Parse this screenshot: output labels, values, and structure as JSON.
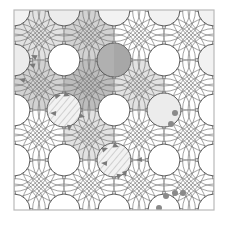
{
  "figure": {
    "type": "geometric-diagram",
    "width": 227,
    "height": 232,
    "background_color": "#ffffff"
  },
  "chart_data": {
    "type": "scatter",
    "xlabel": "",
    "ylabel": "",
    "xlim": [
      0,
      4
    ],
    "ylim": [
      0,
      4
    ],
    "grid": true,
    "legend": "none"
  },
  "frame": {
    "x": 14,
    "y": 10,
    "width": 200,
    "height": 200,
    "cells_x": 4,
    "cells_y": 4,
    "cell_size": 50,
    "border_color": "#b9b9b9",
    "grid_color": "#cfcfcf"
  },
  "colors": {
    "arc_stroke": "#6e6e6e",
    "arc_stroke_dark": "#5a5a5a",
    "shade_light": "#e2e2e2",
    "shade_mid": "#d2d2d2",
    "shade_dark": "#bdbdbd",
    "circle_fill_light": "#f2f2f2",
    "circle_fill_pale": "#ececec",
    "circle_fill_mid": "#d8d8d8",
    "circle_fill_dark": "#b0b0b0",
    "marker_fill": "#8a8a8a",
    "arrow_fill": "#7a7a7a",
    "hatch_stroke": "#9a9a9a"
  },
  "grid_lines": {
    "vertical_x": [
      14,
      64,
      114,
      164,
      214
    ],
    "horizontal_y": [
      10,
      60,
      110,
      160,
      210
    ]
  },
  "shaded_cells": [
    {
      "col": 0,
      "row": 0,
      "tone": "shade_light"
    },
    {
      "col": 1,
      "row": 0,
      "tone": "shade_mid"
    },
    {
      "col": 0,
      "row": 1,
      "tone": "shade_mid"
    },
    {
      "col": 1,
      "row": 1,
      "tone": "shade_dark"
    },
    {
      "col": 2,
      "row": 1,
      "tone": "shade_light"
    },
    {
      "col": 1,
      "row": 2,
      "tone": "shade_light"
    }
  ],
  "nodes": [
    {
      "id": "n-00",
      "col": 0,
      "row": 0,
      "cx": 14,
      "cy": 10,
      "r": 16,
      "fill": "circle_fill_light",
      "style": "plain"
    },
    {
      "id": "n-10",
      "col": 1,
      "row": 0,
      "cx": 64,
      "cy": 10,
      "r": 16,
      "fill": "circle_fill_pale",
      "style": "plain"
    },
    {
      "id": "n-20",
      "col": 2,
      "row": 0,
      "cx": 114,
      "cy": 10,
      "r": 16,
      "fill": "circle_fill_light",
      "style": "plain"
    },
    {
      "id": "n-30",
      "col": 3,
      "row": 0,
      "cx": 164,
      "cy": 10,
      "r": 16,
      "fill": "circle_fill_light",
      "style": "plain"
    },
    {
      "id": "n-40",
      "col": 4,
      "row": 0,
      "cx": 214,
      "cy": 10,
      "r": 16,
      "fill": "circle_fill_light",
      "style": "plain"
    },
    {
      "id": "n-01",
      "col": 0,
      "row": 1,
      "cx": 14,
      "cy": 60,
      "r": 16,
      "fill": "circle_fill_pale",
      "style": "plain"
    },
    {
      "id": "n-11",
      "col": 1,
      "row": 1,
      "cx": 64,
      "cy": 60,
      "r": 16,
      "fill": "none",
      "style": "open"
    },
    {
      "id": "n-21",
      "col": 2,
      "row": 1,
      "cx": 114,
      "cy": 60,
      "r": 17,
      "fill": "circle_fill_dark",
      "style": "solid"
    },
    {
      "id": "n-31",
      "col": 3,
      "row": 1,
      "cx": 164,
      "cy": 60,
      "r": 16,
      "fill": "none",
      "style": "open"
    },
    {
      "id": "n-41",
      "col": 4,
      "row": 1,
      "cx": 214,
      "cy": 60,
      "r": 16,
      "fill": "circle_fill_light",
      "style": "plain"
    },
    {
      "id": "n-02",
      "col": 0,
      "row": 2,
      "cx": 14,
      "cy": 110,
      "r": 16,
      "fill": "none",
      "style": "open"
    },
    {
      "id": "n-12",
      "col": 1,
      "row": 2,
      "cx": 64,
      "cy": 110,
      "r": 17,
      "fill": "circle_fill_light",
      "style": "hatched"
    },
    {
      "id": "n-22",
      "col": 2,
      "row": 2,
      "cx": 114,
      "cy": 110,
      "r": 16,
      "fill": "none",
      "style": "open"
    },
    {
      "id": "n-32",
      "col": 3,
      "row": 2,
      "cx": 164,
      "cy": 110,
      "r": 17,
      "fill": "circle_fill_pale",
      "style": "marked"
    },
    {
      "id": "n-42",
      "col": 4,
      "row": 2,
      "cx": 214,
      "cy": 110,
      "r": 16,
      "fill": "none",
      "style": "open"
    },
    {
      "id": "n-03",
      "col": 0,
      "row": 3,
      "cx": 14,
      "cy": 160,
      "r": 16,
      "fill": "none",
      "style": "open"
    },
    {
      "id": "n-13",
      "col": 1,
      "row": 3,
      "cx": 64,
      "cy": 160,
      "r": 16,
      "fill": "none",
      "style": "open"
    },
    {
      "id": "n-23",
      "col": 2,
      "row": 3,
      "cx": 114,
      "cy": 160,
      "r": 17,
      "fill": "circle_fill_light",
      "style": "hatched"
    },
    {
      "id": "n-33",
      "col": 3,
      "row": 3,
      "cx": 164,
      "cy": 160,
      "r": 16,
      "fill": "none",
      "style": "open"
    },
    {
      "id": "n-43",
      "col": 4,
      "row": 3,
      "cx": 214,
      "cy": 160,
      "r": 16,
      "fill": "none",
      "style": "open"
    },
    {
      "id": "n-04",
      "col": 0,
      "row": 4,
      "cx": 14,
      "cy": 210,
      "r": 16,
      "fill": "none",
      "style": "open"
    },
    {
      "id": "n-14",
      "col": 1,
      "row": 4,
      "cx": 64,
      "cy": 210,
      "r": 16,
      "fill": "none",
      "style": "open"
    },
    {
      "id": "n-24",
      "col": 2,
      "row": 4,
      "cx": 114,
      "cy": 210,
      "r": 16,
      "fill": "none",
      "style": "open"
    },
    {
      "id": "n-34",
      "col": 3,
      "row": 4,
      "cx": 164,
      "cy": 210,
      "r": 16,
      "fill": "none",
      "style": "open"
    },
    {
      "id": "n-44",
      "col": 4,
      "row": 4,
      "cx": 214,
      "cy": 210,
      "r": 16,
      "fill": "none",
      "style": "open"
    }
  ],
  "arrows": [
    {
      "id": "a-1",
      "x": 31,
      "y": 55,
      "angle": 205
    },
    {
      "id": "a-2",
      "x": 29,
      "y": 64,
      "angle": 200
    },
    {
      "id": "a-3",
      "x": 19,
      "y": 79,
      "angle": 195
    },
    {
      "id": "a-4",
      "x": 61,
      "y": 95,
      "angle": 345
    },
    {
      "id": "a-5",
      "x": 70,
      "y": 96,
      "angle": 20
    },
    {
      "id": "a-6",
      "x": 50,
      "y": 113,
      "angle": 185
    },
    {
      "id": "a-7",
      "x": 85,
      "y": 117,
      "angle": 15
    },
    {
      "id": "a-8",
      "x": 69,
      "y": 131,
      "angle": 95
    },
    {
      "id": "a-9",
      "x": 108,
      "y": 148,
      "angle": 340
    },
    {
      "id": "a-10",
      "x": 119,
      "y": 147,
      "angle": 20
    },
    {
      "id": "a-11",
      "x": 101,
      "y": 163,
      "angle": 185
    },
    {
      "id": "a-12",
      "x": 136,
      "y": 160,
      "angle": 175
    },
    {
      "id": "a-13",
      "x": 118,
      "y": 180,
      "angle": 100
    },
    {
      "id": "a-14",
      "x": 126,
      "y": 177,
      "angle": 75
    }
  ],
  "dots": [
    {
      "id": "d-1",
      "x": 175,
      "y": 113,
      "r": 3
    },
    {
      "id": "d-2",
      "x": 171,
      "y": 124,
      "r": 3
    },
    {
      "id": "d-3",
      "x": 166,
      "y": 196,
      "r": 3
    },
    {
      "id": "d-4",
      "x": 175,
      "y": 193,
      "r": 3
    },
    {
      "id": "d-5",
      "x": 183,
      "y": 193,
      "r": 3
    },
    {
      "id": "d-6",
      "x": 159,
      "y": 208,
      "r": 3
    }
  ]
}
